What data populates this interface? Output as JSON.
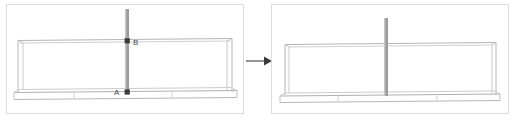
{
  "figure": {
    "type": "cad-perspective-diagram",
    "background_color": "#ffffff",
    "frame_border_color": "#d9d9d9",
    "line_color": "#b9b9b9",
    "line_color_dark": "#8e8e8e",
    "post_color": "#9b9b9b",
    "post_highlight_color": "#c9c9c9",
    "marker_color": "#3b3b3b",
    "arrow_color": "#5a5a5a",
    "label_color": "#4a4a4a"
  },
  "panels": [
    {
      "id": "before",
      "name": "left-panel",
      "frame": {
        "x": 6,
        "y": 4,
        "w": 238,
        "h": 110
      },
      "labels": [
        {
          "id": "label-b",
          "text": "B",
          "x": 134,
          "y": 44
        },
        {
          "id": "label-a",
          "text": "A",
          "x": 115,
          "y": 95
        }
      ],
      "markers": [
        {
          "id": "point-b",
          "x": 128,
          "y": 41
        },
        {
          "id": "point-a",
          "x": 128,
          "y": 92
        }
      ],
      "post": {
        "x": 125,
        "y_top": 9,
        "y_bottom": 94,
        "width": 4
      }
    },
    {
      "id": "after",
      "name": "right-panel",
      "frame": {
        "x": 271,
        "y": 4,
        "w": 238,
        "h": 110
      },
      "labels": [],
      "markers": [],
      "post": {
        "x": 385,
        "y_top": 18,
        "y_bottom": 96,
        "width": 4
      }
    }
  ],
  "arrow": {
    "id": "transform-arrow",
    "direction": "right",
    "x_start": 246,
    "x_end": 270,
    "y": 61,
    "label": ""
  }
}
